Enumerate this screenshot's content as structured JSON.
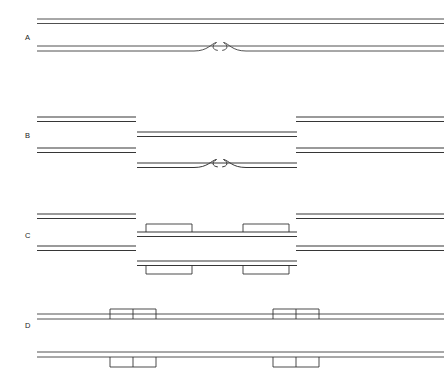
{
  "figure": {
    "title": "",
    "width": 444,
    "height": 378,
    "background_color": "#ffffff",
    "stroke_color": "#2b2b2b",
    "line_color_light": "#3c3c3c",
    "panel_labels": [
      {
        "id": "A",
        "label": "A",
        "x": 25,
        "y": 40
      },
      {
        "id": "B",
        "label": "B",
        "x": 25,
        "y": 138
      },
      {
        "id": "C",
        "label": "C",
        "x": 25,
        "y": 238
      },
      {
        "id": "D",
        "label": "D",
        "x": 25,
        "y": 328
      }
    ],
    "panels": [
      {
        "id": "A",
        "label": "A",
        "description": "Two continuous duplex strands; the lower duplex carries a single nick with curled strand ends at mid-length.",
        "duplexes": [
          {
            "id": "A-top",
            "y_upper": 19,
            "y_lower": 23.5,
            "x_start": 37,
            "x_end": 444,
            "nick": false
          },
          {
            "id": "A-bottom",
            "y_upper": 46,
            "y_lower": 51,
            "x_start": 37,
            "x_end": 444,
            "nick": true,
            "nick_x": 220
          }
        ],
        "boxes": []
      },
      {
        "id": "B",
        "label": "B",
        "description": "Segmented strands forming staggered blocks: left block, offset middle block, right block. Lower middle block shows a nick with curled ends.",
        "segments_top_row": [
          {
            "id": "B-top-left",
            "y_upper": 117,
            "y_lower": 121.5,
            "x_start": 37,
            "x_end": 136,
            "nick": false
          },
          {
            "id": "B-top-middle",
            "y_upper": 132,
            "y_lower": 136.5,
            "x_start": 137,
            "x_end": 297,
            "nick": false
          },
          {
            "id": "B-top-right",
            "y_upper": 117,
            "y_lower": 121.5,
            "x_start": 296,
            "x_end": 444,
            "nick": false
          }
        ],
        "segments_bottom_row": [
          {
            "id": "B-bottom-left",
            "y_upper": 148,
            "y_lower": 152.5,
            "x_start": 37,
            "x_end": 136,
            "nick": false
          },
          {
            "id": "B-bottom-middle",
            "y_upper": 163,
            "y_lower": 167.5,
            "x_start": 137,
            "x_end": 297,
            "nick": true,
            "nick_x": 220
          },
          {
            "id": "B-bottom-right",
            "y_upper": 148,
            "y_lower": 152.5,
            "x_start": 296,
            "x_end": 444,
            "nick": false
          }
        ],
        "boxes": []
      },
      {
        "id": "C",
        "label": "C",
        "description": "Same staggered segments as B, with two raised rectangular blocks bound on each middle segment — above the upper middle bar and below the lower middle bar.",
        "segments_top_row": [
          {
            "id": "C-top-left",
            "y_upper": 214,
            "y_lower": 218.5,
            "x_start": 37,
            "x_end": 136,
            "nick": false
          },
          {
            "id": "C-top-middle",
            "y_upper": 232,
            "y_lower": 236.5,
            "x_start": 137,
            "x_end": 297,
            "nick": false
          },
          {
            "id": "C-top-right",
            "y_upper": 214,
            "y_lower": 218.5,
            "x_start": 296,
            "x_end": 444,
            "nick": false
          }
        ],
        "segments_bottom_row": [
          {
            "id": "C-bottom-left",
            "y_upper": 246,
            "y_lower": 250.5,
            "x_start": 37,
            "x_end": 136,
            "nick": false
          },
          {
            "id": "C-bottom-middle",
            "y_upper": 261,
            "y_lower": 265.5,
            "x_start": 137,
            "x_end": 297,
            "nick": false
          },
          {
            "id": "C-bottom-right",
            "y_upper": 246,
            "y_lower": 250.5,
            "x_start": 296,
            "x_end": 444,
            "nick": false
          }
        ],
        "boxes": [
          {
            "id": "C-box-1",
            "x_start": 146,
            "x_end": 192,
            "y_top": 224,
            "y_bottom": 232,
            "side": "above",
            "divider": false
          },
          {
            "id": "C-box-2",
            "x_start": 243,
            "x_end": 289,
            "y_top": 224,
            "y_bottom": 232,
            "side": "above",
            "divider": false
          },
          {
            "id": "C-box-3",
            "x_start": 146,
            "x_end": 192,
            "y_top": 265.5,
            "y_bottom": 274,
            "side": "below",
            "divider": false
          },
          {
            "id": "C-box-4",
            "x_start": 243,
            "x_end": 289,
            "y_top": 265.5,
            "y_bottom": 274,
            "side": "below",
            "divider": false
          }
        ]
      },
      {
        "id": "D",
        "label": "D",
        "description": "Two continuous duplex strands; each carries two rectangular blocks straddling the strand, each block split by a central vertical divider.",
        "duplexes": [
          {
            "id": "D-top",
            "y_upper": 314,
            "y_lower": 319,
            "x_start": 37,
            "x_end": 444,
            "nick": false
          },
          {
            "id": "D-bottom",
            "y_upper": 352,
            "y_lower": 357,
            "x_start": 37,
            "x_end": 444,
            "nick": false
          }
        ],
        "boxes": [
          {
            "id": "D-box-1",
            "x_start": 110,
            "x_end": 156,
            "y_top": 309,
            "y_bottom": 319,
            "side": "above",
            "divider": true,
            "divider_x": 133
          },
          {
            "id": "D-box-2",
            "x_start": 273,
            "x_end": 319,
            "y_top": 309,
            "y_bottom": 319,
            "side": "above",
            "divider": true,
            "divider_x": 296
          },
          {
            "id": "D-box-3",
            "x_start": 110,
            "x_end": 156,
            "y_top": 357,
            "y_bottom": 367,
            "side": "below",
            "divider": true,
            "divider_x": 133
          },
          {
            "id": "D-box-4",
            "x_start": 273,
            "x_end": 319,
            "y_top": 357,
            "y_bottom": 367,
            "side": "below",
            "divider": true,
            "divider_x": 296
          }
        ]
      }
    ]
  }
}
